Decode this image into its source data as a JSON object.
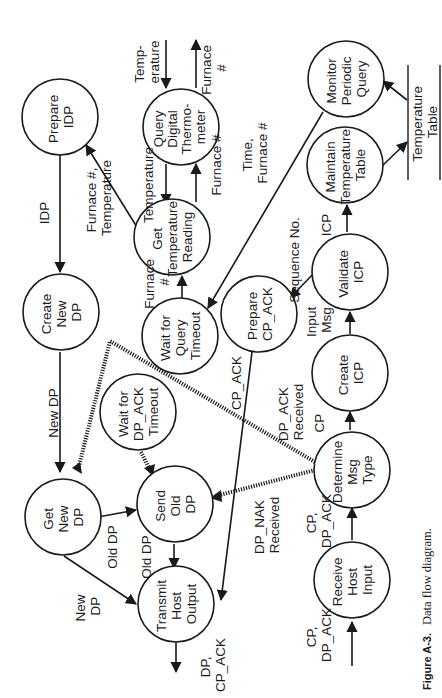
{
  "diagram": {
    "orientation": "rotated-90-ccw",
    "processes": [
      {
        "id": "prepare_idp",
        "lines": [
          "Prepare",
          "IDP"
        ]
      },
      {
        "id": "query_digital_thermometer",
        "lines": [
          "Query",
          "Digital",
          "Thermo-",
          "meter"
        ]
      },
      {
        "id": "monitor_periodic_query",
        "lines": [
          "Monitor",
          "Periodic",
          "Query"
        ]
      },
      {
        "id": "get_temperature_reading",
        "lines": [
          "Get",
          "Temperature",
          "Reading"
        ]
      },
      {
        "id": "maintain_temperature_table",
        "lines": [
          "Maintain",
          "Temperature",
          "Table"
        ]
      },
      {
        "id": "create_new_dp",
        "lines": [
          "Create",
          "New",
          "DP"
        ]
      },
      {
        "id": "wait_for_query_timeout",
        "lines": [
          "Wait for",
          "Query",
          "Timeout"
        ]
      },
      {
        "id": "prepare_cp_ack",
        "lines": [
          "Prepare",
          "CP_ACK"
        ]
      },
      {
        "id": "validate_icp",
        "lines": [
          "Validate",
          "ICP"
        ]
      },
      {
        "id": "wait_for_dp_ack_timeout",
        "lines": [
          "Wait for",
          "DP_ACK",
          "Timeout"
        ]
      },
      {
        "id": "create_icp",
        "lines": [
          "Create",
          "ICP"
        ]
      },
      {
        "id": "get_new_dp",
        "lines": [
          "Get",
          "New",
          "DP"
        ]
      },
      {
        "id": "send_old_dp",
        "lines": [
          "Send",
          "Old",
          "DP"
        ]
      },
      {
        "id": "determine_msg_type",
        "lines": [
          "Determine",
          "Msg",
          "Type"
        ]
      },
      {
        "id": "transmit_host_output",
        "lines": [
          "Transmit",
          "Host",
          "Output"
        ]
      },
      {
        "id": "receive_host_input",
        "lines": [
          "Receive",
          "Host",
          "Input"
        ]
      }
    ],
    "data_store": {
      "lines": [
        "Temperature",
        "Table"
      ]
    },
    "flow_labels": {
      "temperature_in": [
        "Temp-",
        "erature"
      ],
      "furnace_out": [
        "Furnace",
        "#"
      ],
      "temperature_qdt_gtr": [
        "Temperature"
      ],
      "furnace_gtr_qdt": [
        "Furnace #"
      ],
      "furnace_temp_to_idp": [
        "Furnace #,",
        "Temperature"
      ],
      "idp": [
        "IDP"
      ],
      "time_furnace": [
        "Time,",
        "Furnace #"
      ],
      "furnace_wqt_gtr": [
        "Furnace",
        "#"
      ],
      "icp": [
        "ICP"
      ],
      "sequence_no": [
        "Sequence No."
      ],
      "new_dp_1": [
        "New DP"
      ],
      "input_msg": [
        "Input",
        "Msg"
      ],
      "cp_ack": [
        "CP_ACK"
      ],
      "dp_ack_received": [
        "DP_ACK",
        "Received"
      ],
      "cp": [
        "CP"
      ],
      "old_dp_1": [
        "Old DP"
      ],
      "old_dp_2": [
        "Old DP"
      ],
      "new_dp_2": [
        "New",
        "DP"
      ],
      "dp_nak_received": [
        "DP_NAK",
        "Received"
      ],
      "cp_dp_ack_1": [
        "CP,",
        "DP_ACK"
      ],
      "dp_cp_ack": [
        "DP,",
        "CP_ACK"
      ],
      "cp_dp_ack_in": [
        "CP,",
        "DP_ACK"
      ]
    },
    "caption": {
      "label": "Figure A-3.",
      "text": "Data flow diagram."
    }
  }
}
